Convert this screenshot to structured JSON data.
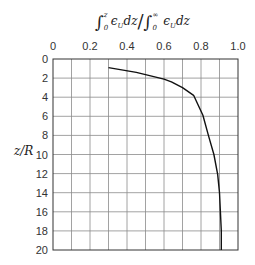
{
  "chart_data": {
    "type": "line",
    "xlabel": "∫₀^z ε_U dz / ∫₀^∞ ε_U dz",
    "ylabel": "z/R",
    "x_ticks": [
      "0",
      "0.2",
      "0.4",
      "0.6",
      "0.8",
      "1.0"
    ],
    "y_ticks": [
      "0",
      "2",
      "4",
      "6",
      "8",
      "10",
      "12",
      "14",
      "16",
      "18",
      "20"
    ],
    "xlim": [
      0,
      1.0
    ],
    "ylim": [
      20,
      0
    ],
    "x_axis_position": "top",
    "y_axis_inverted": true,
    "grid": true,
    "grid_x_step": 0.1,
    "grid_y_step": 2,
    "series": [
      {
        "name": "cumulative strain ratio",
        "points": [
          [
            0.3,
            0.9
          ],
          [
            0.45,
            1.4
          ],
          [
            0.6,
            2.1
          ],
          [
            0.64,
            2.4
          ],
          [
            0.7,
            3.0
          ],
          [
            0.76,
            3.8
          ],
          [
            0.81,
            5.9
          ],
          [
            0.84,
            8.0
          ],
          [
            0.87,
            10.0
          ],
          [
            0.89,
            12.1
          ],
          [
            0.9,
            14.0
          ],
          [
            0.905,
            16.0
          ],
          [
            0.91,
            18.0
          ],
          [
            0.91,
            20.0
          ]
        ]
      }
    ]
  },
  "labels": {
    "ylabel": "z/R",
    "title_num_upper": "z",
    "title_num_lower": "0",
    "title_num_body": "ϵ",
    "title_num_sub": "U",
    "title_dz": "dz",
    "title_slash": "/",
    "title_den_upper": "∞",
    "title_den_lower": "0",
    "title_den_body": "ϵ",
    "title_den_sub": "U",
    "title_den_dz": "dz",
    "integral": "∫"
  },
  "colors": {
    "grid": "#8a8a8a",
    "frame": "#333333",
    "curve": "#111111"
  }
}
